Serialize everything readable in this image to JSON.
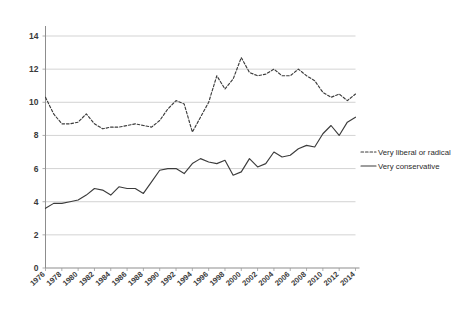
{
  "chart_data": {
    "type": "line",
    "title": "",
    "subtitle": "",
    "xlabel": "",
    "ylabel": "",
    "grid": true,
    "legend_position": "right",
    "ylim": [
      0,
      14
    ],
    "yticks": [
      0,
      2,
      4,
      6,
      8,
      10,
      12,
      14
    ],
    "ytick_labels": [
      "0",
      "2",
      "4",
      "6",
      "8",
      "10",
      "12",
      "14"
    ],
    "xlim": [
      1976,
      2014
    ],
    "xticks": [
      1976,
      1978,
      1980,
      1982,
      1984,
      1986,
      1988,
      1990,
      1992,
      1994,
      1996,
      1998,
      2000,
      2002,
      2004,
      2006,
      2008,
      2010,
      2012,
      2014
    ],
    "xtick_labels": [
      "1976",
      "1978",
      "1980",
      "1982",
      "1984",
      "1986",
      "1988",
      "1990",
      "1992",
      "1994",
      "1996",
      "1998",
      "2000",
      "2002",
      "2004",
      "2006",
      "2008",
      "2010",
      "2012",
      "2014"
    ],
    "x": [
      1976,
      1977,
      1978,
      1979,
      1980,
      1981,
      1982,
      1983,
      1984,
      1985,
      1986,
      1987,
      1988,
      1989,
      1990,
      1991,
      1992,
      1993,
      1994,
      1995,
      1996,
      1997,
      1998,
      1999,
      2000,
      2001,
      2002,
      2003,
      2004,
      2005,
      2006,
      2007,
      2008,
      2009,
      2010,
      2011,
      2012,
      2013,
      2014
    ],
    "series": [
      {
        "name": "Very liberal or radical",
        "style": "dashed",
        "color": "#3c3c3c",
        "values": [
          10.3,
          9.3,
          8.7,
          8.7,
          8.8,
          9.3,
          8.7,
          8.4,
          8.5,
          8.5,
          8.6,
          8.7,
          8.6,
          8.5,
          8.9,
          9.6,
          10.1,
          9.9,
          8.2,
          9.1,
          10.0,
          11.6,
          10.8,
          11.4,
          12.7,
          11.8,
          11.6,
          11.7,
          12.0,
          11.6,
          11.6,
          12.0,
          11.6,
          11.3,
          10.6,
          10.3,
          10.5,
          10.1,
          10.5
        ]
      },
      {
        "name": "Very conservative",
        "style": "solid",
        "color": "#5a5a5a",
        "values": [
          3.6,
          3.9,
          3.9,
          4.0,
          4.1,
          4.4,
          4.8,
          4.7,
          4.4,
          4.9,
          4.8,
          4.8,
          4.5,
          5.2,
          5.9,
          6.0,
          6.0,
          5.7,
          6.3,
          6.6,
          6.4,
          6.3,
          6.5,
          5.6,
          5.8,
          6.6,
          6.1,
          6.3,
          7.0,
          6.7,
          6.8,
          7.2,
          7.4,
          7.3,
          8.1,
          8.6,
          8.0,
          8.8,
          9.1
        ]
      }
    ],
    "legend": [
      {
        "label": "Very liberal or radical",
        "style": "dashed"
      },
      {
        "label": "Very conservative",
        "style": "solid"
      }
    ]
  }
}
